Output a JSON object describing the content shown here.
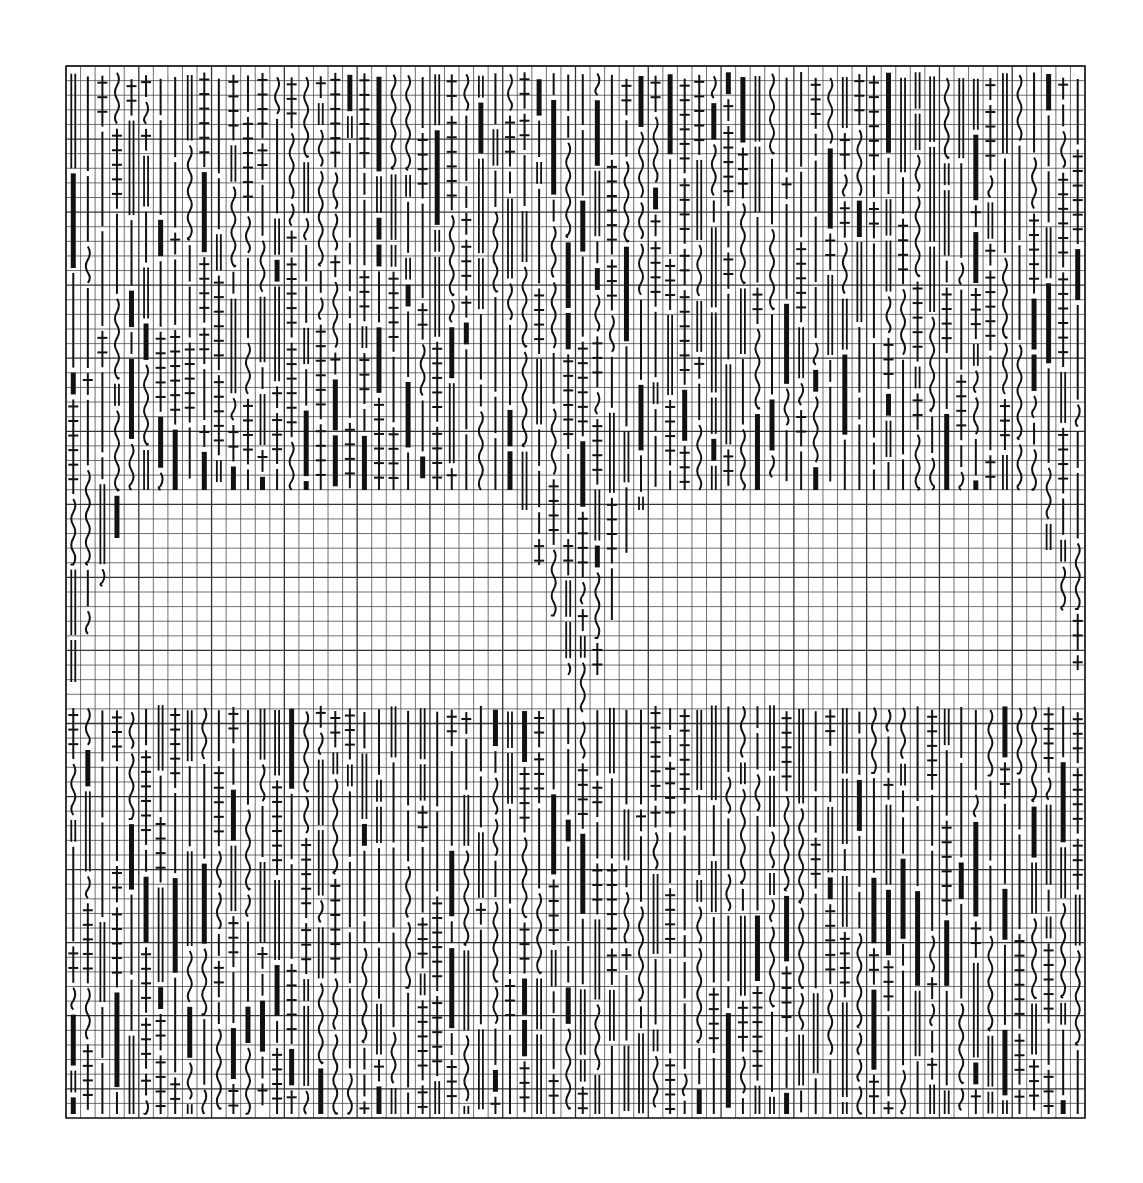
{
  "artwork": {
    "type": "generative-grid-drawing",
    "background": "#ffffff",
    "ink": "#111111",
    "grid_color": "#333333",
    "frame": {
      "x": 66,
      "y": 66,
      "width": 1019,
      "height": 1052
    },
    "cell": 14.56,
    "columns": 70,
    "rows": 72,
    "major_every": 5,
    "glyph_types": [
      "thick-bar",
      "thin-line",
      "wavy-line",
      "double-line",
      "crossed-line"
    ],
    "blank_band": {
      "y_top": 490,
      "y_bottom": 702
    },
    "bands": [
      {
        "name": "top-band",
        "y_start": 72,
        "y_end": 490
      },
      {
        "name": "bottom-band",
        "y_start": 705,
        "y_end": 1114
      }
    ],
    "descents": [
      {
        "name": "left-descent",
        "columns": [
          0,
          1,
          2,
          3
        ],
        "direction": "down-left"
      },
      {
        "name": "center-v",
        "columns": [
          31,
          32,
          33,
          34,
          35,
          36,
          37,
          38,
          39
        ],
        "direction": "v-shape"
      },
      {
        "name": "right-descent",
        "columns": [
          67,
          68,
          69
        ],
        "direction": "down-right"
      }
    ],
    "seed": 7
  }
}
